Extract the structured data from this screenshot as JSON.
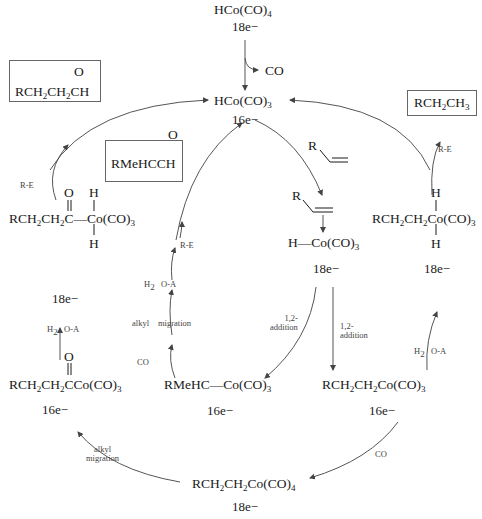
{
  "diagram": {
    "species": {
      "precatalyst": {
        "formula": "HCo(CO)4",
        "electrons": "18e−"
      },
      "catalyst": {
        "formula": "HCo(CO)3",
        "electrons": "16e−"
      },
      "alkene_complex": {
        "formula": "H—Co(CO)3",
        "electrons": "18e−"
      },
      "linear_alkyl": {
        "formula": "RCH2CH2Co(CO)3",
        "electrons": "16e−"
      },
      "branched_alkyl": {
        "formula": "RMeHC—Co(CO)3",
        "electrons": "16e−"
      },
      "alkyl_tetracarbonyl": {
        "formula": "RCH2CH2Co(CO)4",
        "electrons": "18e−"
      },
      "acyl": {
        "formula": "RCH2CH2CCo(CO)3",
        "electrons": "16e−"
      },
      "acyl_dihydride": {
        "formula": "RCH2CH2C—Co(CO)3",
        "electrons": "18e−"
      },
      "alkyl_dihydride": {
        "formula": "RCH2CH2Co(CO)3",
        "electrons": "18e−"
      },
      "alkene_reactant": "R",
      "alkene_coordinated": "R"
    },
    "products": {
      "linear_aldehyde": "RCH2CH2CH",
      "branched_aldehyde": "RMeHCCH",
      "alkane": "RCH2CH3"
    },
    "step_labels": {
      "co_loss": "CO",
      "addition_12_a": "1,2-\naddition",
      "addition_12_b": "1,2-\naddition",
      "co_add_right": "CO",
      "alkyl_migration_bottom": "alkyl\nmigration",
      "h2_oa_left_h2": "H2",
      "h2_oa_left_oa": "O-A",
      "re_left": "R-E",
      "h2_oa_right_h2": "H2",
      "h2_oa_right_oa": "O-A",
      "re_right": "R-E",
      "co_add_mid": "CO",
      "alkyl_mid": "alkyl",
      "migration_mid": "migration",
      "h2_mid": "H2",
      "oa_mid": "O-A",
      "re_mid": "R-E"
    },
    "atoms": {
      "O": "O",
      "H": "H"
    },
    "colors": {
      "line": "#555555",
      "text": "#1a1a1a",
      "box_border": "#666666"
    }
  }
}
